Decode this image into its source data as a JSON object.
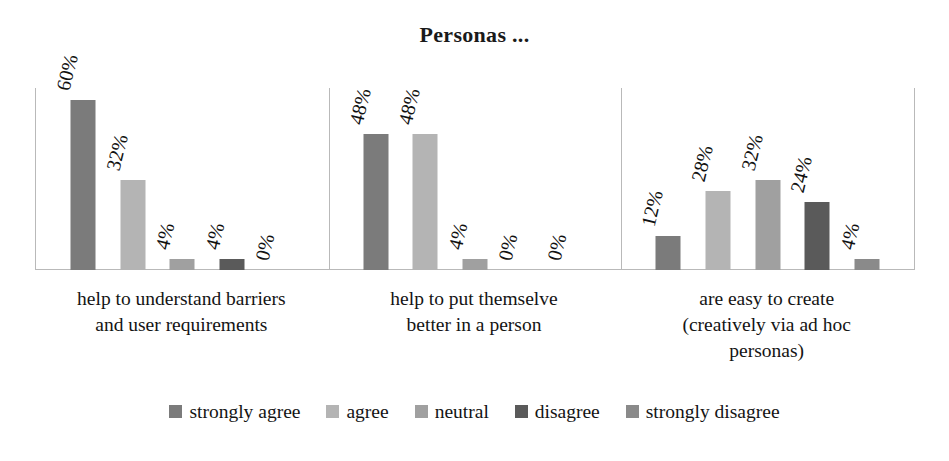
{
  "chart_data": {
    "type": "bar",
    "title": "Personas ...",
    "xlabel": "",
    "ylabel": "",
    "ylim": [
      0,
      64
    ],
    "grid": false,
    "legend_position": "bottom",
    "categories": [
      "help to understand barriers and user requirements",
      "help to put themselve better in a person",
      "are easy to create (creatively via ad hoc personas)"
    ],
    "category_lines": [
      [
        "help to understand barriers",
        "and user requirements"
      ],
      [
        "help to put themselve",
        "better in a person"
      ],
      [
        "are easy to create",
        "(creatively via ad hoc",
        "personas)"
      ]
    ],
    "series": [
      {
        "name": "strongly agree",
        "color": "#7b7b7b",
        "values": [
          60,
          48,
          12
        ],
        "labels": [
          "60%",
          "48%",
          "12%"
        ]
      },
      {
        "name": "agree",
        "color": "#b4b4b4",
        "values": [
          32,
          48,
          28
        ],
        "labels": [
          "32%",
          "48%",
          "28%"
        ]
      },
      {
        "name": "neutral",
        "color": "#a0a0a0",
        "values": [
          4,
          4,
          32
        ],
        "labels": [
          "4%",
          "4%",
          "32%"
        ]
      },
      {
        "name": "disagree",
        "color": "#5a5a5a",
        "values": [
          4,
          0,
          24
        ],
        "labels": [
          "4%",
          "0%",
          "24%"
        ]
      },
      {
        "name": "strongly disagree",
        "color": "#8a8a8a",
        "values": [
          0,
          0,
          4
        ],
        "labels": [
          "0%",
          "0%",
          "4%"
        ]
      }
    ]
  },
  "chart": {
    "title": "Personas ...",
    "axis_color": "#b9b9b9",
    "background": "#ffffff"
  },
  "legend": {
    "items": [
      {
        "label": "strongly agree",
        "color": "#7b7b7b"
      },
      {
        "label": "agree",
        "color": "#b4b4b4"
      },
      {
        "label": "neutral",
        "color": "#a0a0a0"
      },
      {
        "label": "disagree",
        "color": "#5a5a5a"
      },
      {
        "label": "strongly disagree",
        "color": "#8a8a8a"
      }
    ]
  }
}
